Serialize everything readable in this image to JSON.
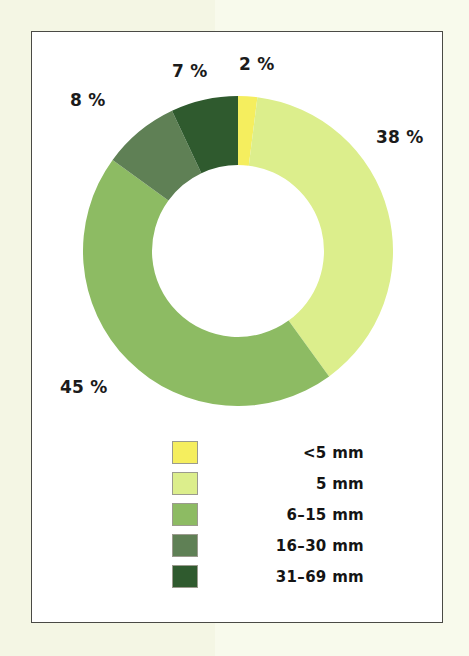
{
  "page": {
    "background_color": "#f4f6e4",
    "frame_border_color": "#4a4a45",
    "frame_background_color": "#ffffff"
  },
  "chart_data": {
    "type": "pie",
    "variant": "donut",
    "title": "",
    "subtitle": "",
    "xlabel": "",
    "ylabel": "",
    "units": "percent",
    "total": 100,
    "start_angle_deg": 0,
    "direction": "clockwise",
    "legend_position": "bottom",
    "grid": false,
    "categories": [
      "<5 mm",
      "5 mm",
      "6–15 mm",
      "16–30 mm",
      "31–69 mm"
    ],
    "values": [
      2,
      38,
      45,
      8,
      7
    ],
    "colors": [
      "#f5ee5e",
      "#dcee8c",
      "#8dbb63",
      "#5f8055",
      "#2f5a2e"
    ],
    "slices": [
      {
        "label": "<5 mm",
        "value": 2,
        "display": "2 %",
        "color": "#f5ee5e"
      },
      {
        "label": "5 mm",
        "value": 38,
        "display": "38 %",
        "color": "#dcee8c"
      },
      {
        "label": "6–15 mm",
        "value": 45,
        "display": "45 %",
        "color": "#8dbb63"
      },
      {
        "label": "16–30 mm",
        "value": 8,
        "display": "8 %",
        "color": "#5f8055"
      },
      {
        "label": "31–69 mm",
        "value": 7,
        "display": "7 %",
        "color": "#2f5a2e"
      }
    ],
    "data_labels": {
      "pct_2": "2 %",
      "pct_38": "38 %",
      "pct_45": "45 %",
      "pct_8": "8 %",
      "pct_7": "7 %"
    },
    "legend": {
      "entries": [
        {
          "label": "<5 mm",
          "color": "#f5ee5e"
        },
        {
          "label": "5 mm",
          "color": "#dcee8c"
        },
        {
          "label": "6–15 mm",
          "color": "#8dbb63"
        },
        {
          "label": "16–30 mm",
          "color": "#5f8055"
        },
        {
          "label": "31–69 mm",
          "color": "#2f5a2e"
        }
      ]
    }
  }
}
